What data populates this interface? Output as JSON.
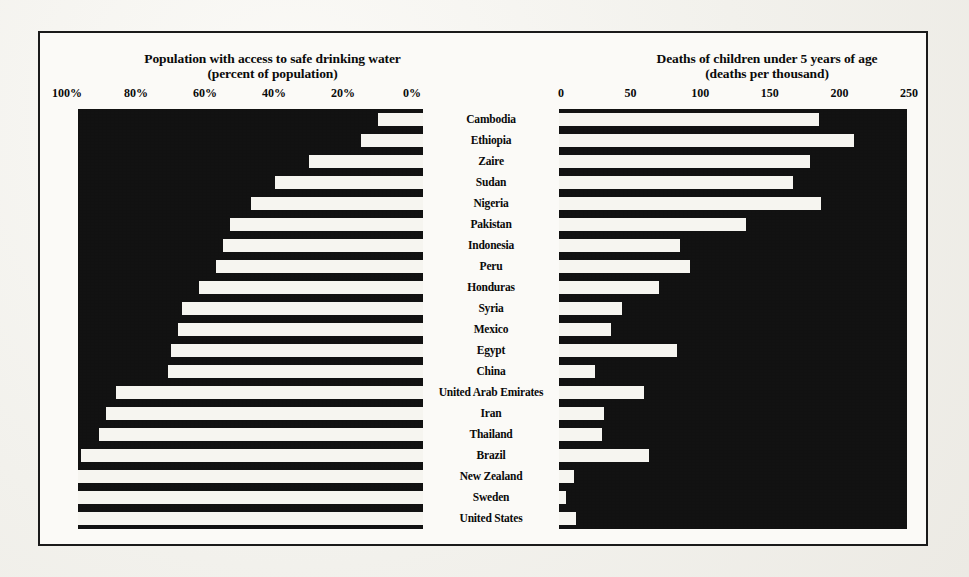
{
  "figure": {
    "left_panel": {
      "title_line1": "Population with access to safe drinking water",
      "title_line2": "(percent of population)",
      "tick_labels": [
        "100%",
        "80%",
        "60%",
        "40%",
        "20%",
        "0%"
      ]
    },
    "right_panel": {
      "title_line1": "Deaths of children under 5 years of age",
      "title_line2": "(deaths per thousand)",
      "tick_labels": [
        "0",
        "50",
        "100",
        "150",
        "200",
        "250"
      ]
    }
  },
  "chart_data": [
    {
      "type": "bar",
      "orientation": "horizontal",
      "title": "Population with access to safe drinking water",
      "subtitle": "(percent of population)",
      "xlabel": "percent of population",
      "ylabel": "",
      "xlim": [
        100,
        0
      ],
      "x_reversed": true,
      "xticks": [
        100,
        80,
        60,
        40,
        20,
        0
      ],
      "xtick_labels": [
        "100%",
        "80%",
        "60%",
        "40%",
        "20%",
        "0%"
      ],
      "grid": false,
      "legend": "none",
      "bar_color": "#f6f5f0",
      "plot_background": "#121212",
      "categories": [
        "Cambodia",
        "Ethiopia",
        "Zaire",
        "Sudan",
        "Nigeria",
        "Pakistan",
        "Indonesia",
        "Peru",
        "Honduras",
        "Syria",
        "Mexico",
        "Egypt",
        "China",
        "United Arab Emirates",
        "Iran",
        "Thailand",
        "Brazil",
        "New Zealand",
        "Sweden",
        "United States"
      ],
      "values": [
        13,
        18,
        33,
        43,
        50,
        56,
        58,
        60,
        65,
        70,
        71,
        73,
        74,
        89,
        92,
        94,
        99,
        100,
        100,
        100
      ]
    },
    {
      "type": "bar",
      "orientation": "horizontal",
      "title": "Deaths of children under 5 years of age",
      "subtitle": "(deaths per thousand)",
      "xlabel": "deaths per thousand",
      "ylabel": "",
      "xlim": [
        0,
        250
      ],
      "x_reversed": false,
      "xticks": [
        0,
        50,
        100,
        150,
        200,
        250
      ],
      "xtick_labels": [
        "0",
        "50",
        "100",
        "150",
        "200",
        "250"
      ],
      "grid": false,
      "legend": "none",
      "bar_color": "#f6f5f0",
      "plot_background": "#121212",
      "categories": [
        "Cambodia",
        "Ethiopia",
        "Zaire",
        "Sudan",
        "Nigeria",
        "Pakistan",
        "Indonesia",
        "Peru",
        "Honduras",
        "Syria",
        "Mexico",
        "Egypt",
        "China",
        "United Arab Emirates",
        "Iran",
        "Thailand",
        "Brazil",
        "New Zealand",
        "Sweden",
        "United States"
      ],
      "values": [
        187,
        212,
        180,
        168,
        188,
        134,
        87,
        94,
        72,
        45,
        37,
        85,
        26,
        61,
        32,
        31,
        65,
        11,
        5,
        12
      ]
    }
  ]
}
